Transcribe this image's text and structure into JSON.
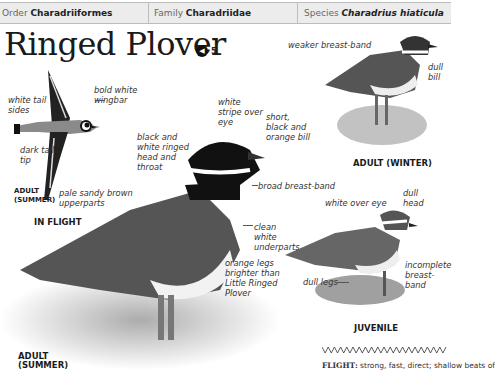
{
  "header": {
    "order_label": "Order",
    "order_value": "Charadriiformes",
    "family_label": "Family",
    "family_value": "Charadriidae",
    "species_label": "Species",
    "species_value": "Charadrius hiaticula"
  },
  "title": "Ringed Plover",
  "sound": {
    "icon": "speaker-icon",
    "track": "5"
  },
  "flight_figure": {
    "labels": {
      "wingbar": "bold white wingbar",
      "tail_sides": "white tail sides",
      "tail_tip": "dark tail tip"
    },
    "caption_small": "ADULT (SUMMER)",
    "caption": "IN FLIGHT"
  },
  "main_figure": {
    "labels": {
      "eye_stripe": "white stripe over eye",
      "bill": "short, black and orange bill",
      "head": "black and white ringed head and throat",
      "upperparts": "pale sandy brown upperparts",
      "breast": "broad breast-band",
      "underparts": "clean white underparts",
      "legs": "orange legs brighter than Little Ringed Plover"
    },
    "caption": "ADULT (SUMMER)"
  },
  "winter_figure": {
    "labels": {
      "breast": "weaker breast-band",
      "bill": "dull bill"
    },
    "caption": "ADULT (WINTER)"
  },
  "juvenile_figure": {
    "labels": {
      "eye": "white over eye",
      "head": "dull head",
      "breast": "incomplete breast-band",
      "legs": "dull legs"
    },
    "caption": "JUVENILE"
  },
  "flight_text": {
    "label": "FLIGHT:",
    "text": "strong, fast, direct; shallow beats of"
  }
}
